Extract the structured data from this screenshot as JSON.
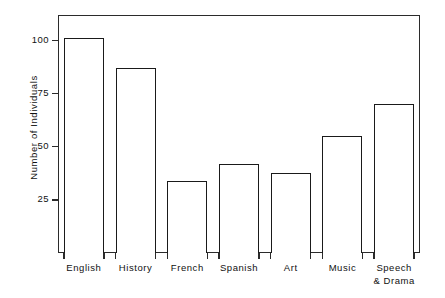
{
  "chart_data": {
    "type": "bar",
    "title": "",
    "subtitle": "",
    "xlabel": "",
    "ylabel": "Number of Individuals",
    "categories": [
      "English",
      "History",
      "French",
      "Spanish",
      "Art",
      "Music",
      "Speech\n& Drama"
    ],
    "values": [
      101,
      87,
      34,
      42,
      37.5,
      55,
      70
    ],
    "ylim": [
      0,
      112
    ],
    "yticks": [
      25,
      50,
      75,
      100
    ],
    "ytick_labels": [
      "25",
      "50",
      "75",
      "100"
    ],
    "grid": false,
    "legend": null,
    "bar_style": {
      "fill": "#ffffff",
      "edge": "#1a1a1a"
    },
    "frame": {
      "color": "#2b2b2b",
      "sides": [
        "left",
        "right",
        "top",
        "bottom"
      ]
    },
    "background": "#ffffff"
  }
}
